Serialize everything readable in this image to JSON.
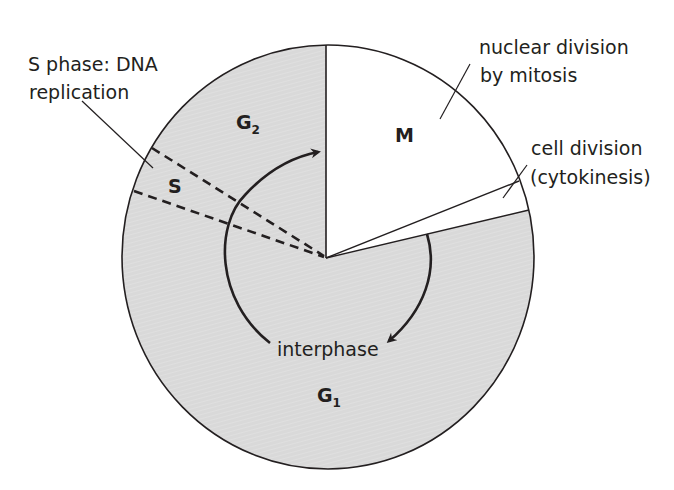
{
  "diagram": {
    "colors": {
      "interphase_fill": "#d9d9d9",
      "mitosis_fill": "#ffffff",
      "stroke": "#231f20",
      "background": "#ffffff"
    },
    "phases": [
      {
        "id": "G1",
        "label": "G",
        "subscript": "1"
      },
      {
        "id": "S",
        "label": "S",
        "subscript": ""
      },
      {
        "id": "G2",
        "label": "G",
        "subscript": "2"
      },
      {
        "id": "M",
        "label": "M",
        "subscript": ""
      }
    ],
    "annotations": {
      "s_phase": {
        "line1": "S phase: DNA",
        "line2": "replication"
      },
      "mitosis": {
        "line1": "nuclear division",
        "line2": "by mitosis"
      },
      "cytokinesis": {
        "line1": "cell division",
        "line2": "(cytokinesis)"
      },
      "interphase": "interphase"
    },
    "icons": {
      "cycle_arrow_left": "curved-arrow-clockwise",
      "cycle_arrow_right": "curved-arrow-clockwise"
    }
  }
}
